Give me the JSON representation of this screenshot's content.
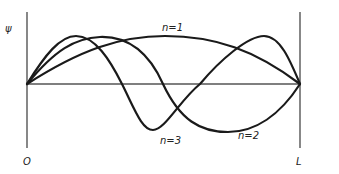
{
  "diagram": {
    "y_axis_label": "ψ",
    "x_start_label": "O",
    "x_end_label": "L",
    "curves": [
      {
        "name": "n=1",
        "label": "n=1"
      },
      {
        "name": "n=2",
        "label": "n=2"
      },
      {
        "name": "n=3",
        "label": "n=3"
      }
    ],
    "colors": {
      "curve": "#1a1a1a",
      "axis": "#555555",
      "background": "#ffffff"
    }
  }
}
